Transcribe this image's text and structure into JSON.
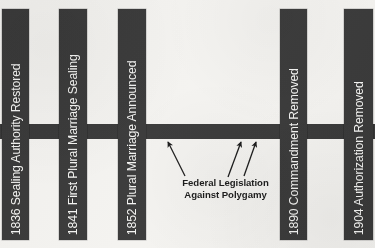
{
  "diagram": {
    "type": "timeline",
    "colors": {
      "bar": "#3b3b3b",
      "bar_text": "#f3f3f1",
      "background": "#f2f1ee",
      "annotation_text": "#1d1d1d"
    },
    "axis": {
      "name": "timeline-axis",
      "orientation": "horizontal"
    },
    "events": [
      {
        "year": "1836",
        "event": "Sealing Authority Restored",
        "label": "1836 Sealing Authority Restored"
      },
      {
        "year": "1841",
        "event": "First Plural Marriage Sealing",
        "label": "1841 First Plural Marriage Sealing"
      },
      {
        "year": "1852",
        "event": "Plural Marriage Announced",
        "label": "1852 Plural Marriage Announced"
      },
      {
        "year": "1890",
        "event": "Commandment Removed",
        "label": "1890 Commandment Removed"
      },
      {
        "year": "1904",
        "event": "Authorization Removed",
        "label": "1904 Authorization Removed"
      }
    ],
    "annotation": {
      "line1": "Federal Legislation",
      "line2": "Against Polygamy",
      "text": "Federal Legislation Against Polygamy",
      "arrow_count": 3
    }
  }
}
